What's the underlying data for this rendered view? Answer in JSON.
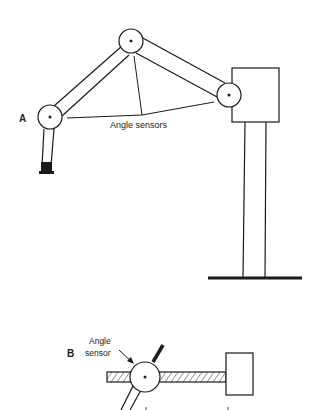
{
  "figure": {
    "panel_a": {
      "label": "A",
      "annotation": "Angle sensors"
    },
    "panel_b": {
      "label": "B",
      "annotation_line1": "Angle",
      "annotation_line2": "sensor"
    }
  },
  "colors": {
    "stroke": "#1a1a1a",
    "background": "#ffffff"
  }
}
